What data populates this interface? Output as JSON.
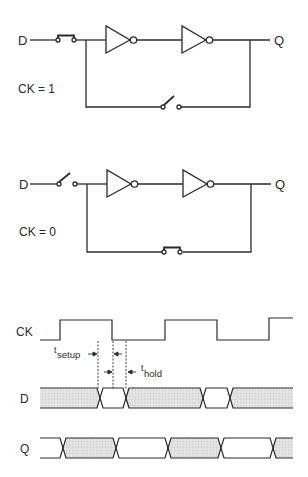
{
  "top_circuit": {
    "input_label": "D",
    "output_label": "Q",
    "condition_label": "CK = 1",
    "input_switch_state": "closed",
    "feedback_switch_state": "open"
  },
  "bottom_circuit": {
    "input_label": "D",
    "output_label": "Q",
    "condition_label": "CK = 0",
    "input_switch_state": "open",
    "feedback_switch_state": "closed"
  },
  "timing": {
    "signals": [
      {
        "label": "CK",
        "type": "clock"
      },
      {
        "label": "D",
        "type": "data"
      },
      {
        "label": "Q",
        "type": "data"
      }
    ],
    "setup_label_main": "t",
    "setup_label_sub": "setup",
    "hold_label_main": "t",
    "hold_label_sub": "hold"
  },
  "colors": {
    "line": "#2a2a2a",
    "hatch_fill": "#d9d9d9",
    "background": "#ffffff"
  }
}
